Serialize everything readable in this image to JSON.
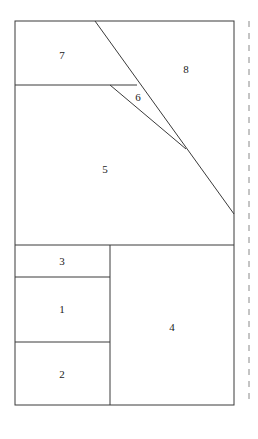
{
  "figure": {
    "name": "partitioned-rectangle-diagram",
    "background_color": "#ffffff",
    "stroke_color": "#3a3a3a",
    "stroke_width": 1,
    "label_color": "#1a1a1a",
    "label_font_size": 11,
    "canvas": {
      "width": 258,
      "height": 439
    },
    "outline": {
      "x": 15,
      "y": 21,
      "width": 219,
      "height": 384
    },
    "dashed_guide": {
      "name": "dashed-vertical-guide",
      "x": 249,
      "y_start": 21,
      "y_end": 405,
      "dash_pattern": "6 6"
    },
    "lines": [
      {
        "name": "region-7-bottom-edge",
        "x1": 15,
        "y1": 85,
        "x2": 137,
        "y2": 85
      },
      {
        "name": "region-5-bottom-edge",
        "x1": 15,
        "y1": 245,
        "x2": 234,
        "y2": 245
      },
      {
        "name": "bottom-vertical-divider",
        "x1": 110,
        "y1": 245,
        "x2": 110,
        "y2": 405
      },
      {
        "name": "region-3-bottom-edge",
        "x1": 15,
        "y1": 277,
        "x2": 110,
        "y2": 277
      },
      {
        "name": "region-1-bottom-edge",
        "x1": 15,
        "y1": 342,
        "x2": 110,
        "y2": 342
      },
      {
        "name": "diagonal-long-cut",
        "x1": 95,
        "y1": 21,
        "x2": 234,
        "y2": 214
      },
      {
        "name": "diagonal-short-cut",
        "x1": 110,
        "y1": 85,
        "x2": 186,
        "y2": 149
      }
    ],
    "labels": [
      {
        "name": "region-label-7",
        "text": "7",
        "x": 62,
        "y": 55
      },
      {
        "name": "region-label-8",
        "text": "8",
        "x": 186,
        "y": 69
      },
      {
        "name": "region-label-6",
        "text": "6",
        "x": 138,
        "y": 97
      },
      {
        "name": "region-label-5",
        "text": "5",
        "x": 105,
        "y": 169
      },
      {
        "name": "region-label-3",
        "text": "3",
        "x": 62,
        "y": 261
      },
      {
        "name": "region-label-1",
        "text": "1",
        "x": 62,
        "y": 309
      },
      {
        "name": "region-label-4",
        "text": "4",
        "x": 172,
        "y": 327
      },
      {
        "name": "region-label-2",
        "text": "2",
        "x": 62,
        "y": 374
      }
    ]
  }
}
